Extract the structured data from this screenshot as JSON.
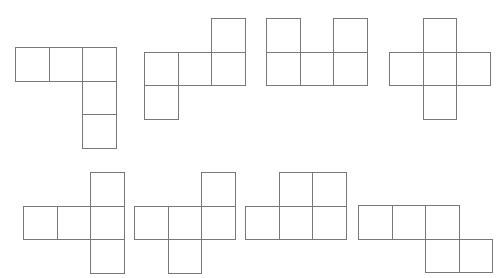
{
  "canvas": {
    "width": 499,
    "height": 278,
    "background_color": "#ffffff",
    "stroke_color": "#787878",
    "stroke_width": 1,
    "cell_size": 33.5
  },
  "figures": [
    {
      "name": "figure-1-l-net",
      "label": "L net",
      "origin_x": 15,
      "origin_y": 47,
      "cells": [
        {
          "col": 0,
          "row": 0
        },
        {
          "col": 1,
          "row": 0
        },
        {
          "col": 2,
          "row": 0
        },
        {
          "col": 2,
          "row": 1
        },
        {
          "col": 2,
          "row": 2
        }
      ]
    },
    {
      "name": "figure-2-s-net",
      "label": "S net",
      "origin_x": 144,
      "origin_y": 18,
      "cells": [
        {
          "col": 2,
          "row": 0
        },
        {
          "col": 0,
          "row": 1
        },
        {
          "col": 1,
          "row": 1
        },
        {
          "col": 2,
          "row": 1
        },
        {
          "col": 0,
          "row": 2
        }
      ]
    },
    {
      "name": "figure-3-u-net",
      "label": "U net",
      "origin_x": 266,
      "origin_y": 18,
      "cells": [
        {
          "col": 0,
          "row": 0
        },
        {
          "col": 2,
          "row": 0
        },
        {
          "col": 0,
          "row": 1
        },
        {
          "col": 1,
          "row": 1
        },
        {
          "col": 2,
          "row": 1
        }
      ]
    },
    {
      "name": "figure-4-plus-net",
      "label": "Plus net",
      "origin_x": 389,
      "origin_y": 18,
      "cells": [
        {
          "col": 1,
          "row": 0
        },
        {
          "col": 0,
          "row": 1
        },
        {
          "col": 1,
          "row": 1
        },
        {
          "col": 2,
          "row": 1
        },
        {
          "col": 1,
          "row": 2
        }
      ]
    },
    {
      "name": "figure-5-t-net",
      "label": "T net",
      "origin_x": 23,
      "origin_y": 172,
      "cells": [
        {
          "col": 2,
          "row": 0
        },
        {
          "col": 0,
          "row": 1
        },
        {
          "col": 1,
          "row": 1
        },
        {
          "col": 2,
          "row": 1
        },
        {
          "col": 2,
          "row": 2
        }
      ]
    },
    {
      "name": "figure-6-z-net",
      "label": "Z net",
      "origin_x": 134,
      "origin_y": 172,
      "cells": [
        {
          "col": 2,
          "row": 0
        },
        {
          "col": 0,
          "row": 1
        },
        {
          "col": 1,
          "row": 1
        },
        {
          "col": 2,
          "row": 1
        },
        {
          "col": 1,
          "row": 2
        }
      ]
    },
    {
      "name": "figure-7-p-net",
      "label": "P net",
      "origin_x": 245,
      "origin_y": 172,
      "cells": [
        {
          "col": 1,
          "row": 0
        },
        {
          "col": 2,
          "row": 0
        },
        {
          "col": 0,
          "row": 1
        },
        {
          "col": 1,
          "row": 1
        },
        {
          "col": 2,
          "row": 1
        }
      ]
    },
    {
      "name": "figure-8-n-net",
      "label": "N net",
      "origin_x": 358,
      "origin_y": 205,
      "cells": [
        {
          "col": 0,
          "row": 0
        },
        {
          "col": 1,
          "row": 0
        },
        {
          "col": 2,
          "row": 0
        },
        {
          "col": 2,
          "row": 1
        },
        {
          "col": 3,
          "row": 1
        }
      ]
    }
  ]
}
